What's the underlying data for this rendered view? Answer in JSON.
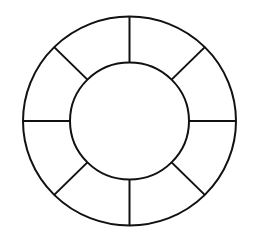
{
  "diagram": {
    "type": "segmented-ring",
    "background": "#ffffff",
    "stroke_color": "#111111",
    "stroke_width": 2,
    "center": {
      "x": 129.5,
      "y": 121
    },
    "outer_circle": {
      "rx": 106.5,
      "ry": 104.5
    },
    "inner_circle": {
      "rx": 59.5,
      "ry": 58.5
    },
    "spoke_count": 8,
    "spoke_angles_deg": [
      0,
      45,
      90,
      135,
      180,
      225,
      270,
      315
    ],
    "segments": [
      {
        "index": 0,
        "label": ""
      },
      {
        "index": 1,
        "label": ""
      },
      {
        "index": 2,
        "label": ""
      },
      {
        "index": 3,
        "label": ""
      },
      {
        "index": 4,
        "label": ""
      },
      {
        "index": 5,
        "label": ""
      },
      {
        "index": 6,
        "label": ""
      },
      {
        "index": 7,
        "label": ""
      }
    ],
    "center_label": ""
  }
}
